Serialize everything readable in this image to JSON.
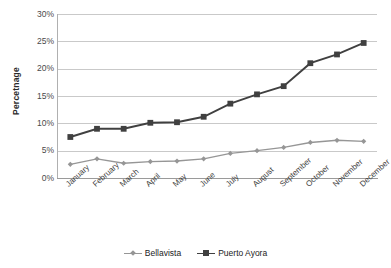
{
  "axes": {
    "y_title": "Percetnage",
    "y_ticks": [
      "30%",
      "25%",
      "20%",
      "15%",
      "10%",
      "5%",
      "0%"
    ],
    "x_ticks": [
      "January",
      "February",
      "March",
      "April",
      "May",
      "June",
      "July",
      "August",
      "September",
      "October",
      "November",
      "December"
    ]
  },
  "legend": {
    "items": [
      {
        "label": "Bellavista",
        "color": "#969696",
        "marker": "diamond"
      },
      {
        "label": "Puerto Ayora",
        "color": "#404040",
        "marker": "square"
      }
    ]
  },
  "chart_data": {
    "type": "line",
    "title": "",
    "xlabel": "",
    "ylabel": "Percetnage",
    "ylim": [
      0,
      30
    ],
    "ytick_step": 5,
    "grid": true,
    "legend_position": "bottom",
    "categories": [
      "January",
      "February",
      "March",
      "April",
      "May",
      "June",
      "July",
      "August",
      "September",
      "October",
      "November",
      "December"
    ],
    "series": [
      {
        "name": "Bellavista",
        "color": "#969696",
        "marker": "diamond",
        "values": [
          2.5,
          3.5,
          2.7,
          3.0,
          3.1,
          3.5,
          4.5,
          5.0,
          5.6,
          6.5,
          6.9,
          6.7
        ]
      },
      {
        "name": "Puerto Ayora",
        "color": "#404040",
        "marker": "square",
        "values": [
          7.5,
          9.0,
          9.0,
          10.1,
          10.2,
          11.2,
          13.6,
          15.3,
          16.8,
          21.0,
          22.6,
          24.7
        ]
      }
    ]
  }
}
